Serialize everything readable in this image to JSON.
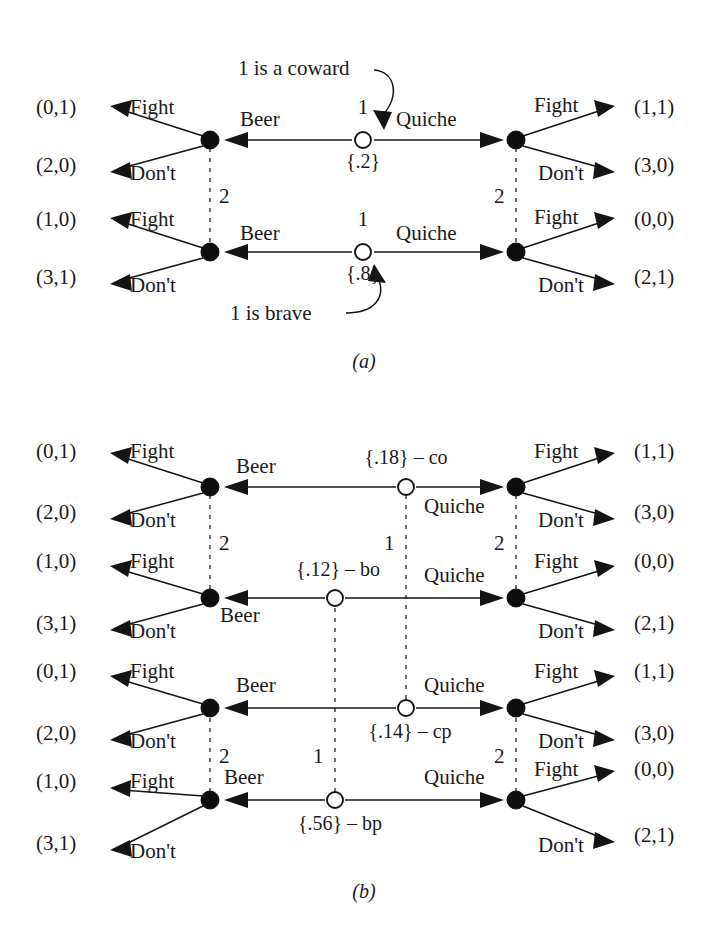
{
  "figure": {
    "panels": [
      {
        "caption": "(a)",
        "id": "panel-a"
      },
      {
        "caption": "(b)",
        "id": "panel-b"
      }
    ]
  },
  "labels": {
    "fight": "Fight",
    "dont": "Don't",
    "beer": "Beer",
    "quiche": "Quiche",
    "player1": "1",
    "player2": "2"
  },
  "panel_a": {
    "caption": "(a)",
    "annotations": [
      {
        "name": "coward-note",
        "text": "1 is a coward"
      },
      {
        "name": "brave-note",
        "text": "1 is brave"
      }
    ],
    "nature_nodes": [
      {
        "name": "coward-type",
        "player": "1",
        "prob": "{.2}"
      },
      {
        "name": "brave-type",
        "player": "1",
        "prob": "{.8}"
      }
    ],
    "info_sets": [
      {
        "name": "beer-info-set",
        "player": "2"
      },
      {
        "name": "quiche-info-set",
        "player": "2"
      }
    ],
    "rows": [
      {
        "name": "coward-row",
        "signal_left": "Beer",
        "signal_right": "Quiche",
        "left_fight_payoff": "(0,1)",
        "left_dont_payoff": "(2,0)",
        "right_fight_payoff": "(1,1)",
        "right_dont_payoff": "(3,0)"
      },
      {
        "name": "brave-row",
        "signal_left": "Beer",
        "signal_right": "Quiche",
        "left_fight_payoff": "(1,0)",
        "left_dont_payoff": "(3,1)",
        "right_fight_payoff": "(0,0)",
        "right_dont_payoff": "(2,1)"
      }
    ]
  },
  "panel_b": {
    "caption": "(b)",
    "nature_nodes": [
      {
        "name": "co-node",
        "label": "{.18} – co"
      },
      {
        "name": "bo-node",
        "label": "{.12} – bo"
      },
      {
        "name": "cp-node",
        "label": "{.14} – cp"
      },
      {
        "name": "bp-node",
        "label": "{.56} – bp"
      }
    ],
    "info_sets": [
      {
        "name": "beer-info-set-upper",
        "player": "2"
      },
      {
        "name": "quiche-info-set-upper",
        "player": "2"
      },
      {
        "name": "beer-info-set-lower",
        "player": "2"
      },
      {
        "name": "quiche-info-set-lower",
        "player": "2"
      },
      {
        "name": "type-info-set-o",
        "player": "1"
      },
      {
        "name": "type-info-set-p",
        "player": "1"
      }
    ],
    "rows": [
      {
        "name": "co-row",
        "signal_left": "Beer",
        "signal_right": "Quiche",
        "left_fight_payoff": "(0,1)",
        "left_dont_payoff": "(2,0)",
        "right_fight_payoff": "(1,1)",
        "right_dont_payoff": "(3,0)"
      },
      {
        "name": "bo-row",
        "signal_left": "Beer",
        "signal_right": "Quiche",
        "left_fight_payoff": "(1,0)",
        "left_dont_payoff": "(3,1)",
        "right_fight_payoff": "(0,0)",
        "right_dont_payoff": "(2,1)"
      },
      {
        "name": "cp-row",
        "signal_left": "Beer",
        "signal_right": "Quiche",
        "left_fight_payoff": "(0,1)",
        "left_dont_payoff": "(2,0)",
        "right_fight_payoff": "(1,1)",
        "right_dont_payoff": "(3,0)"
      },
      {
        "name": "bp-row",
        "signal_left": "Beer",
        "signal_right": "Quiche",
        "left_fight_payoff": "(1,0)",
        "left_dont_payoff": "(3,1)",
        "right_fight_payoff": "(0,0)",
        "right_dont_payoff": "(2,1)"
      }
    ]
  },
  "colors": {
    "ink": "#1a1a1a",
    "background": "#ffffff",
    "dashed": "#4a4a4a"
  }
}
